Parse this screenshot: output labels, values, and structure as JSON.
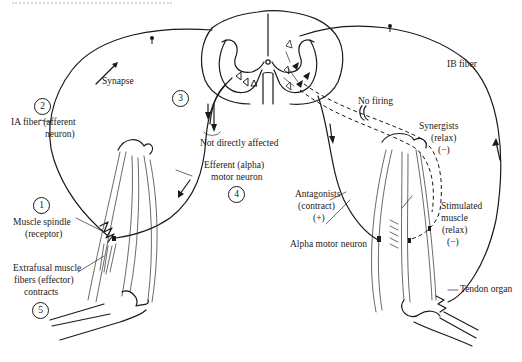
{
  "figure": {
    "type": "stretch reflex / reciprocal inhibition diagram",
    "labels": {
      "synapse": "Synapse",
      "ia_fiber_line1": "IA fiber (afferent",
      "ia_fiber_line2": "neuron)",
      "not_directly_affected": "Not directly affected",
      "efferent_line1": "Efferent (alpha)",
      "efferent_line2": "motor neuron",
      "muscle_spindle_line1": "Muscle spindle",
      "muscle_spindle_line2": "(receptor)",
      "extrafusal_line1": "Extrafusal muscle",
      "extrafusal_line2": "fibers (effector)",
      "extrafusal_line3": "contracts",
      "ib_fiber": "IB fiber",
      "no_firing": "No firing",
      "synergists_line1": "Synergists",
      "synergists_line2": "(relax)",
      "synergists_line3": "(−)",
      "antagonists_line1": "Antagonists",
      "antagonists_line2": "(contract)",
      "antagonists_line3": "(+)",
      "alpha_motor_neuron": "Alpha motor neuron",
      "stimulated_line1": "Stimulated",
      "stimulated_line2": "muscle",
      "stimulated_line3": "(relax)",
      "stimulated_line4": "(−)",
      "tendon_organ": "Tendon organ"
    },
    "step_numbers": {
      "muscle_spindle": "1",
      "ia_fiber": "2",
      "synapse": "3",
      "efferent": "4",
      "extrafusal": "5"
    }
  }
}
